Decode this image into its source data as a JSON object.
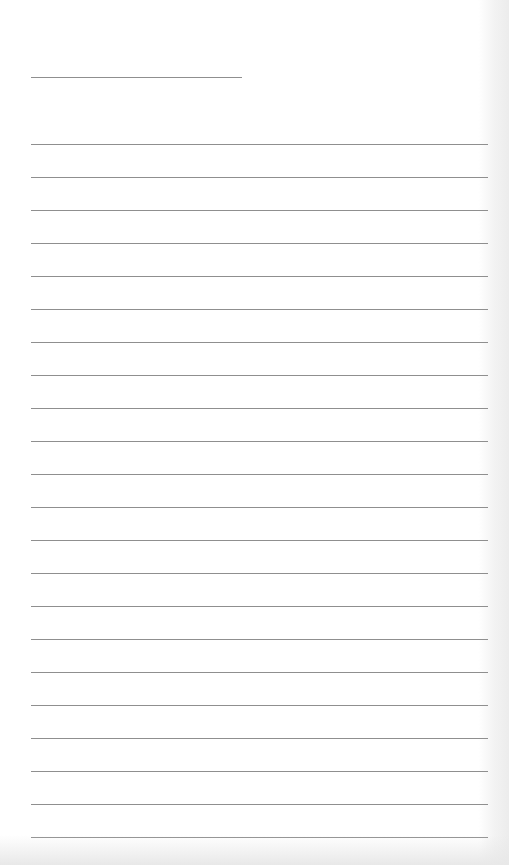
{
  "page": {
    "type": "lined-paper",
    "background_color": "#ffffff",
    "line_color": "#8f8f8f",
    "header_line": {
      "x": 31,
      "y": 77,
      "width": 211
    },
    "ruled_lines": {
      "count": 22,
      "start_y": 144,
      "spacing": 33,
      "x": 31,
      "width": 457
    }
  }
}
